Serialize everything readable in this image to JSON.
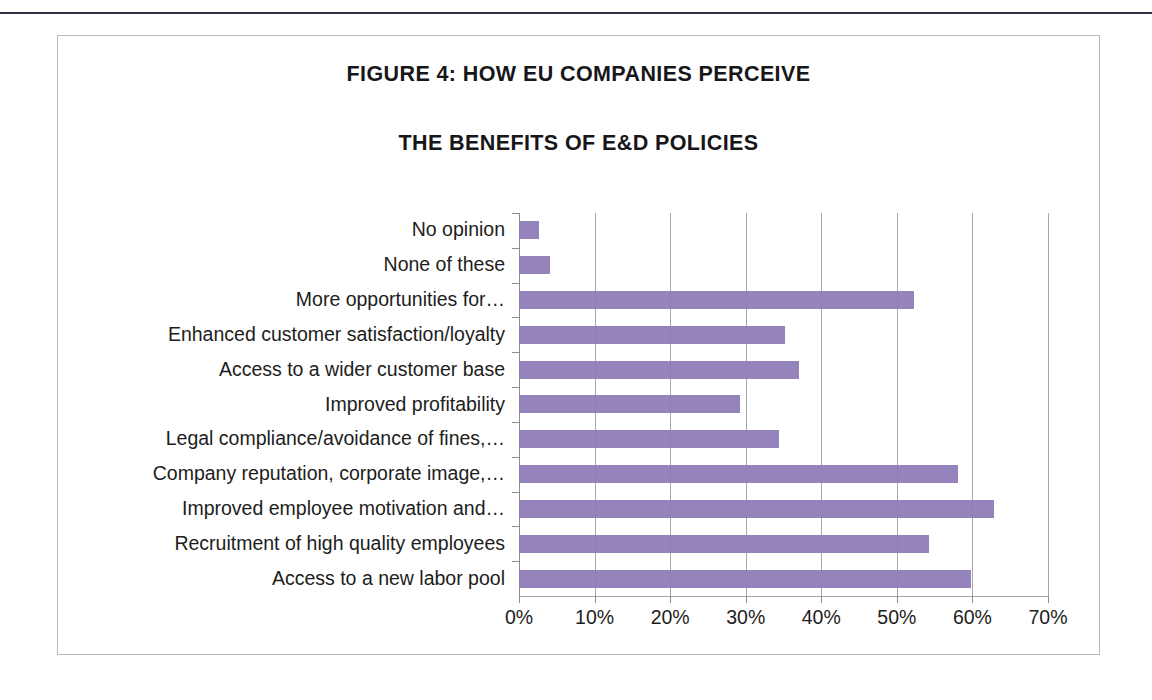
{
  "figure": {
    "title_line_1": "FIGURE 4:  HOW EU COMPANIES PERCEIVE",
    "title_line_2": "THE BENEFITS OF E&D POLICIES",
    "bar_color": "#8c79b6",
    "frame_color": "#b9b9bd",
    "gridline_color": "#a6a6ab",
    "rule_color": "#2b3042"
  },
  "chart_data": {
    "type": "bar",
    "orientation": "horizontal",
    "title": "FIGURE 4:  HOW EU COMPANIES PERCEIVE THE BENEFITS OF E&D POLICIES",
    "xlabel": "",
    "ylabel": "",
    "xlim": [
      0,
      70
    ],
    "xtick_labels": [
      "0%",
      "10%",
      "20%",
      "30%",
      "40%",
      "50%",
      "60%",
      "70%"
    ],
    "xticks": [
      0,
      10,
      20,
      30,
      40,
      50,
      60,
      70
    ],
    "grid": true,
    "legend": false,
    "units": "percent",
    "categories": [
      "No opinion",
      "None of these",
      "More opportunities for…",
      "Enhanced customer satisfaction/loyalty",
      "Access to a wider customer base",
      "Improved profitability",
      "Legal compliance/avoidance of fines,…",
      "Company reputation, corporate image,…",
      "Improved employee motivation and…",
      "Recruitment of high quality employees",
      "Access to a new labor pool"
    ],
    "values": [
      2.6,
      4.1,
      52.3,
      35.2,
      37.1,
      29.2,
      34.4,
      58.1,
      62.9,
      54.3,
      59.8
    ],
    "series": [
      {
        "name": "Perceived benefit",
        "values": [
          2.6,
          4.1,
          52.3,
          35.2,
          37.1,
          29.2,
          34.4,
          58.1,
          62.9,
          54.3,
          59.8
        ]
      }
    ]
  }
}
